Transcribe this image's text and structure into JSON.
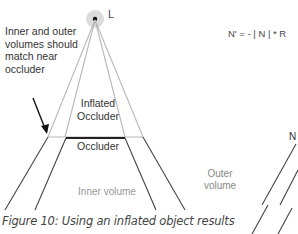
{
  "figure": {
    "light_label": "L",
    "annotation": "Inner and outer volumes should match near occluder",
    "inflated_occluder_label": "Inflated Occluder",
    "occluder_label": "Occluder",
    "outer_volume_label": "Outer volume",
    "inner_volume_label": "Inner volume",
    "formula": "N' = - | N | * R",
    "normal_label": "N",
    "caption": "Figure 10: Using an inflated object results"
  },
  "colors": {
    "light_glow": "#d9d9d9",
    "light_point": "#111111",
    "guide_lines": "#b5b5b5",
    "volume_lines": "#444444",
    "occluder_bar": "#222222",
    "arrow": "#111111"
  }
}
